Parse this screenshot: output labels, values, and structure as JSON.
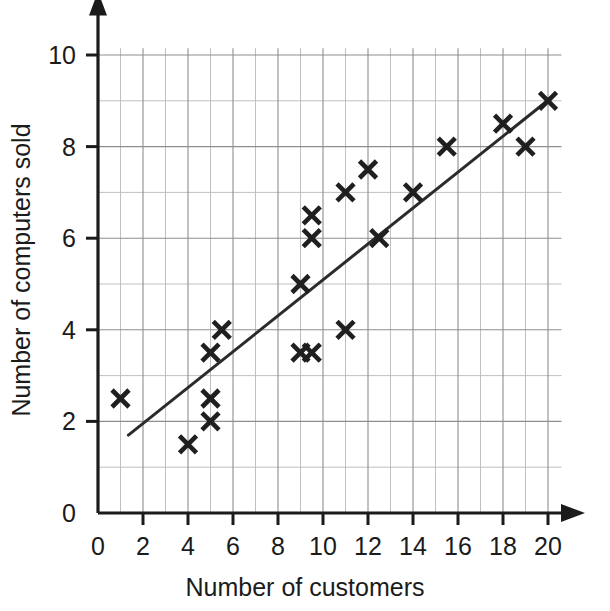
{
  "chart_data": {
    "type": "scatter",
    "title": "",
    "xlabel": "Number of customers",
    "ylabel": "Number of computers sold",
    "xlim": [
      0,
      21.2
    ],
    "ylim": [
      0,
      10.6
    ],
    "grid": true,
    "legend": "none",
    "marker": "x-cross",
    "x_ticks": [
      0,
      2,
      4,
      6,
      8,
      10,
      12,
      14,
      16,
      18,
      20
    ],
    "x_tick_labels": [
      "0",
      "2",
      "4",
      "6",
      "8",
      "10",
      "12",
      "14",
      "16",
      "18",
      "20"
    ],
    "y_ticks": [
      0,
      2,
      4,
      6,
      8,
      10
    ],
    "y_tick_labels": [
      "0",
      "2",
      "4",
      "6",
      "8",
      "10"
    ],
    "minor_grid_step_x": 1,
    "minor_grid_step_y": 1,
    "points": [
      {
        "x": 1,
        "y": 2.5
      },
      {
        "x": 4,
        "y": 1.5
      },
      {
        "x": 5,
        "y": 2
      },
      {
        "x": 5,
        "y": 2.5
      },
      {
        "x": 5,
        "y": 3.5
      },
      {
        "x": 5.5,
        "y": 4
      },
      {
        "x": 9,
        "y": 3.5
      },
      {
        "x": 9.5,
        "y": 3.5
      },
      {
        "x": 9,
        "y": 5
      },
      {
        "x": 9.5,
        "y": 6
      },
      {
        "x": 9.5,
        "y": 6.5
      },
      {
        "x": 11,
        "y": 4
      },
      {
        "x": 11,
        "y": 7
      },
      {
        "x": 12,
        "y": 7.5
      },
      {
        "x": 12.5,
        "y": 6
      },
      {
        "x": 14,
        "y": 7
      },
      {
        "x": 15.5,
        "y": 8
      },
      {
        "x": 18,
        "y": 8.5
      },
      {
        "x": 19,
        "y": 8
      },
      {
        "x": 20,
        "y": 9
      }
    ],
    "trend_line": {
      "label": "line of best fit",
      "x0": 1.35,
      "y0": 1.7,
      "x1": 20.1,
      "y1": 9.05
    },
    "colors": {
      "marker": "#1f1f1f",
      "trend_line": "#2b2b2b",
      "axis": "#1b1b1b",
      "grid_major": "#8e8e8e",
      "grid_minor": "#b9b9b9",
      "background": "#ffffff"
    }
  }
}
